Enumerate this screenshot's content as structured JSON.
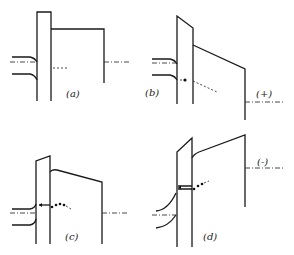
{
  "figure": {
    "panels": [
      {
        "id": "a",
        "label": "(a)",
        "bias_label": ""
      },
      {
        "id": "b",
        "label": "(b)",
        "bias_label": "(+)"
      },
      {
        "id": "c",
        "label": "(c)",
        "bias_label": ""
      },
      {
        "id": "d",
        "label": "(d)",
        "bias_label": "(-)"
      }
    ]
  }
}
